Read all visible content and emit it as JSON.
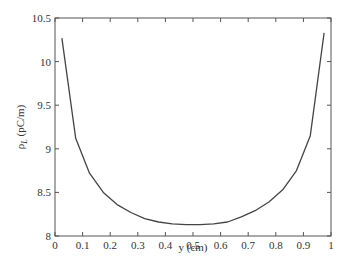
{
  "chart_data": {
    "type": "line",
    "title": "",
    "xlabel": "y (cm)",
    "ylabel": "ρL (pC/m)",
    "ylabel_main": "ρ",
    "ylabel_sub": "L",
    "ylabel_unit": " (pC/m)",
    "xlim": [
      0,
      1
    ],
    "ylim": [
      8,
      10.5
    ],
    "grid": false,
    "legend": null,
    "x_ticks": [
      0,
      0.1,
      0.2,
      0.3,
      0.4,
      0.5,
      0.6,
      0.7,
      0.8,
      0.9,
      1
    ],
    "x_tick_labels": [
      "0",
      "0.1",
      "0.2",
      "0.3",
      "0.4",
      "0.5",
      "0.6",
      "0.7",
      "0.8",
      "0.9",
      "1"
    ],
    "y_ticks": [
      8,
      8.5,
      9,
      9.5,
      10,
      10.5
    ],
    "y_tick_labels": [
      "8",
      "8.5",
      "9",
      "9.5",
      "10",
      "10.5"
    ],
    "series": [
      {
        "name": "ρL",
        "color": "#444444",
        "x": [
          0.025,
          0.075,
          0.125,
          0.175,
          0.225,
          0.275,
          0.325,
          0.375,
          0.425,
          0.475,
          0.525,
          0.575,
          0.625,
          0.675,
          0.725,
          0.775,
          0.825,
          0.875,
          0.925,
          0.975
        ],
        "values": [
          10.27,
          9.12,
          8.72,
          8.5,
          8.36,
          8.27,
          8.2,
          8.16,
          8.14,
          8.13,
          8.13,
          8.14,
          8.16,
          8.22,
          8.29,
          8.39,
          8.53,
          8.75,
          9.15,
          10.33
        ]
      }
    ]
  }
}
